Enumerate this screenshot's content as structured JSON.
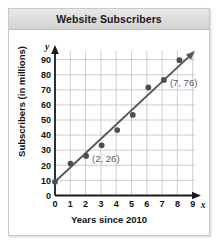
{
  "figure": {
    "title": "Website Subscribers"
  },
  "chart_data": {
    "type": "scatter",
    "title": "Website Subscribers",
    "xlabel": "Years since 2010",
    "ylabel": "Subscribers (in millions)",
    "x_axis_variable": "x",
    "y_axis_variable": "y",
    "xlim": [
      0,
      9
    ],
    "ylim": [
      0,
      95
    ],
    "xticks": [
      "0",
      "1",
      "2",
      "3",
      "4",
      "5",
      "6",
      "7",
      "8",
      "9"
    ],
    "yticks": [
      "0",
      "10",
      "20",
      "30",
      "40",
      "50",
      "60",
      "70",
      "80",
      "90"
    ],
    "grid": true,
    "legend": "none",
    "x": [
      0,
      1,
      2,
      3,
      4,
      5,
      6,
      7,
      8
    ],
    "values": [
      9,
      21,
      26,
      33,
      43,
      53,
      71,
      76,
      89
    ],
    "points": [
      {
        "x": 0,
        "y": 9
      },
      {
        "x": 1,
        "y": 21
      },
      {
        "x": 2,
        "y": 26
      },
      {
        "x": 3,
        "y": 33
      },
      {
        "x": 4,
        "y": 43
      },
      {
        "x": 5,
        "y": 53
      },
      {
        "x": 6,
        "y": 71
      },
      {
        "x": 7,
        "y": 76
      },
      {
        "x": 8,
        "y": 89
      }
    ],
    "trend_line": {
      "label": "line of fit",
      "x_start": 0,
      "y_start": 9,
      "x_end": 9,
      "y_end": 95,
      "arrow": true
    },
    "annotations": [
      {
        "label": "(2, 26)",
        "x": 2,
        "y": 26
      },
      {
        "label": "(7, 76)",
        "x": 7,
        "y": 76
      }
    ]
  }
}
